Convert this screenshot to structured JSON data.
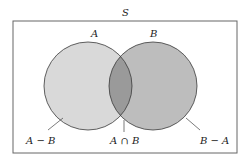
{
  "diagram": {
    "universe_label": "S",
    "set_a_label": "A",
    "set_b_label": "B",
    "region_a_minus_b": "A − B",
    "region_intersection": "A ∩ B",
    "region_b_minus_a": "B − A",
    "colors": {
      "border": "#666666",
      "a_fill": "#d9d9d9",
      "b_fill": "#bdbdbd",
      "intersection_fill": "#9a9a9a",
      "outline": "#3a3a3a"
    }
  }
}
